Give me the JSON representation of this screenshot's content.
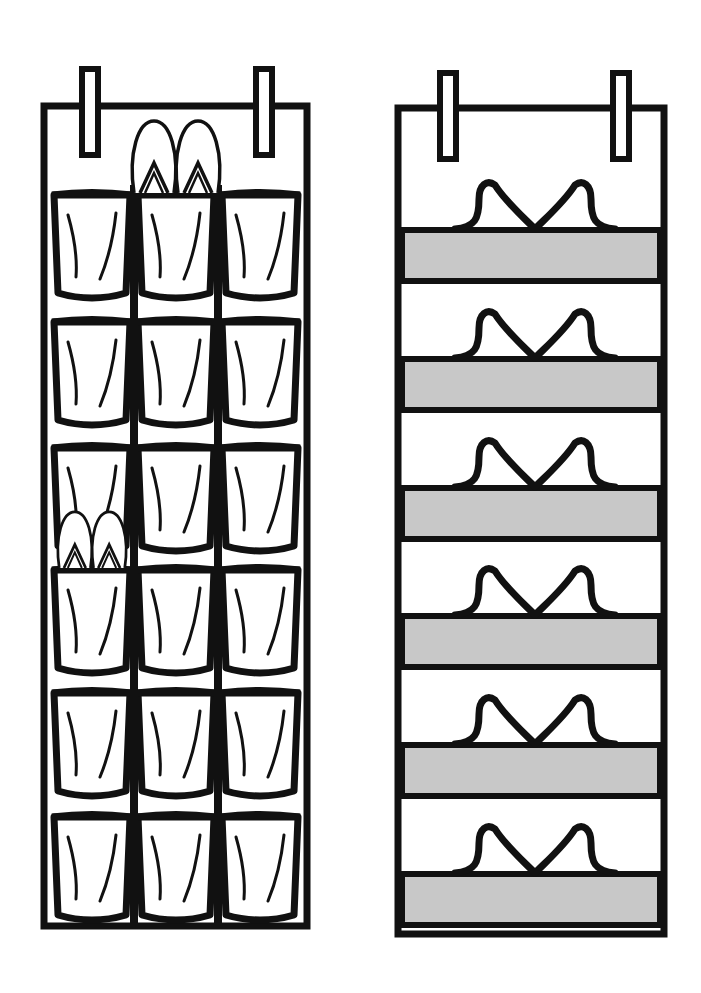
{
  "illustration": {
    "subject": "two over-the-door hanging shoe organizers",
    "colors": {
      "ink": "#111111",
      "paper": "#ffffff",
      "shelf_fill": "#c8c8c8"
    }
  },
  "left_organizer": {
    "type": "pocket organizer",
    "columns": 3,
    "rows": 6,
    "pocket_count": 18,
    "hooks": 2,
    "items": [
      {
        "kind": "flip-flops",
        "row": 1,
        "column": 2
      },
      {
        "kind": "flip-flops",
        "row": 4,
        "column": 1
      }
    ]
  },
  "right_organizer": {
    "type": "shelf organizer",
    "shelves": 6,
    "hooks": 2,
    "items": [
      {
        "kind": "sandals",
        "shelf": 1
      },
      {
        "kind": "sandals",
        "shelf": 2
      },
      {
        "kind": "sandals",
        "shelf": 3
      },
      {
        "kind": "sandals",
        "shelf": 4
      },
      {
        "kind": "sandals",
        "shelf": 5
      },
      {
        "kind": "sandals",
        "shelf": 6
      }
    ]
  }
}
